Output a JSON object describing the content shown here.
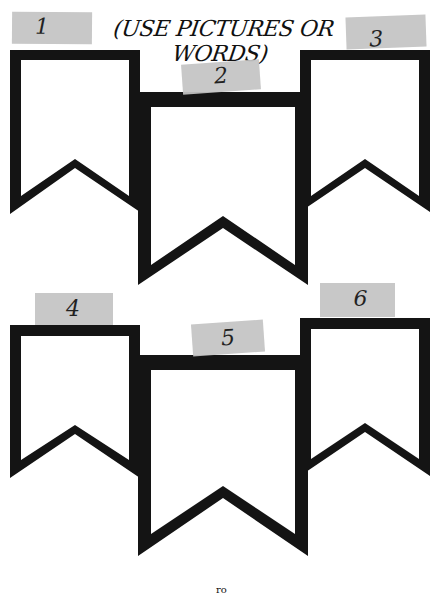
{
  "header": {
    "instruction": "(USE PICTURES OR WORDS)"
  },
  "colors": {
    "banner_stroke": "#141414",
    "banner_fill": "#ffffff",
    "tape": "#c4c4c4",
    "text": "#111111"
  },
  "banners": [
    {
      "number": "1",
      "row": "top",
      "position": "left"
    },
    {
      "number": "2",
      "row": "top",
      "position": "middle"
    },
    {
      "number": "3",
      "row": "top",
      "position": "right"
    },
    {
      "number": "4",
      "row": "bottom",
      "position": "left"
    },
    {
      "number": "5",
      "row": "bottom",
      "position": "middle"
    },
    {
      "number": "6",
      "row": "bottom",
      "position": "right"
    }
  ],
  "footer": {
    "mark": "ro"
  }
}
